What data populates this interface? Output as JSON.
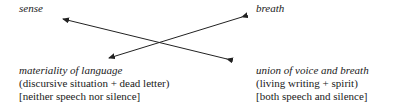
{
  "diagram": {
    "top_left": "sense",
    "top_right": "breath",
    "bottom_left": {
      "title": "materiality of language",
      "line1": "(discursive situation + dead letter)",
      "line2": "[neither speech nor silence]"
    },
    "bottom_right": {
      "title": "union of voice and breath",
      "line1": "(living writing + spirit)",
      "line2": "[both speech and silence]"
    },
    "arrows": [
      {
        "from": "bottom-right",
        "to": "sense",
        "bidirectional": true
      },
      {
        "from": "materiality-of-language",
        "to": "breath",
        "bidirectional": true
      }
    ]
  }
}
